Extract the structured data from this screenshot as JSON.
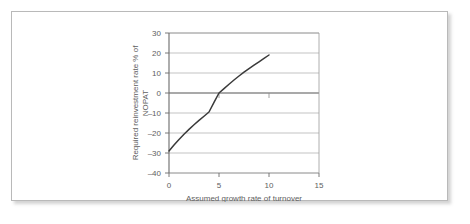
{
  "figure": {
    "background_color": "#ffffff",
    "border_color": "#b9b9b9"
  },
  "chart_data": {
    "type": "line",
    "title": "",
    "subtitle": "",
    "xlabel": "Assumed growth rate of turnover",
    "ylabel_line1": "Required reinvestment rate % of",
    "ylabel_line2": "NOPAT",
    "ylabel": "Required reinvestment rate % of NOPAT",
    "xlim": [
      0,
      15
    ],
    "ylim": [
      -40,
      30
    ],
    "xticks": [
      0,
      5,
      10,
      15
    ],
    "xtick_labels": [
      "0",
      "5",
      "10",
      "15"
    ],
    "yticks": [
      30,
      20,
      10,
      0,
      -10,
      -20,
      -30,
      -40
    ],
    "ytick_labels": [
      "30",
      "20",
      "10",
      "0",
      "–10",
      "–20",
      "–30",
      "–40"
    ],
    "grid": true,
    "grid_axis": "y",
    "legend": false,
    "legend_position": "none",
    "zero_line_emphasis": true,
    "series": [
      {
        "name": "Required reinvestment rate",
        "color": "#3a3a3a",
        "x": [
          0,
          0.5,
          1,
          1.5,
          2,
          2.5,
          3,
          3.5,
          4,
          4.5,
          5,
          5.5,
          6,
          6.5,
          7,
          7.5,
          8,
          8.5,
          9,
          9.5,
          10
        ],
        "values": [
          -29.0,
          -26.0,
          -23.2,
          -20.6,
          -18.2,
          -15.9,
          -13.7,
          -11.6,
          -9.5,
          -4.7,
          0.0,
          2.2,
          4.4,
          6.5,
          8.5,
          10.4,
          12.2,
          13.9,
          15.6,
          17.3,
          19.0
        ]
      }
    ],
    "annotations": [
      {
        "name": "inner-tick-x5",
        "x": 5,
        "y": 0,
        "kind": "minor-tick-below-zero-line"
      },
      {
        "name": "inner-tick-x10",
        "x": 10,
        "y": 0,
        "kind": "minor-tick-below-zero-line"
      }
    ]
  }
}
